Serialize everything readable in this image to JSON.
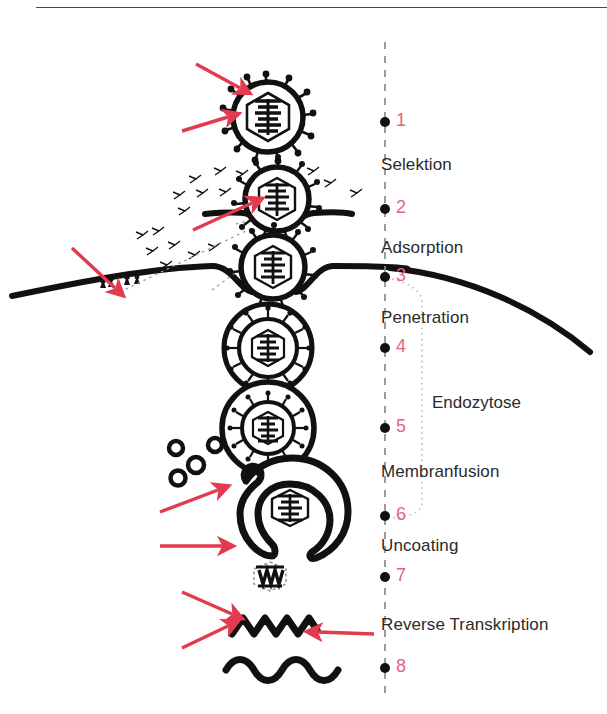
{
  "figure": {
    "colors": {
      "arrow_red": "#e23a4e",
      "number_red": "#e8647a",
      "ink_black": "#111111",
      "text_gray": "#2b2b2b",
      "rule_gray": "#4a4a4a",
      "background": "#ffffff"
    }
  },
  "timeline": {
    "axis_name": "infection-stage-axis",
    "points": [
      {
        "num": "1",
        "x": 385,
        "y": 122,
        "label": "",
        "label_x": 0,
        "label_y": 0
      },
      {
        "num": "2",
        "x": 385,
        "y": 209,
        "label": "Selektion",
        "label_x": 381,
        "label_y": 155
      },
      {
        "num": "3",
        "x": 385,
        "y": 277,
        "label": "Adsorption",
        "label_x": 381,
        "label_y": 238
      },
      {
        "num": "4",
        "x": 385,
        "y": 348,
        "label": "Penetration",
        "label_x": 381,
        "label_y": 308
      },
      {
        "num": "5",
        "x": 385,
        "y": 428,
        "label": "",
        "label_x": 0,
        "label_y": 0
      },
      {
        "num": "6",
        "x": 385,
        "y": 516,
        "label": "Membranfusion",
        "label_x": 381,
        "label_y": 462
      },
      {
        "num": "7",
        "x": 385,
        "y": 577,
        "label": "Uncoating",
        "label_x": 381,
        "label_y": 536
      },
      {
        "num": "8",
        "x": 385,
        "y": 668,
        "label": "Reverse Transkription",
        "label_x": 381,
        "label_y": 615
      }
    ]
  },
  "bracket": {
    "label": "Endozytose",
    "label_x": 432,
    "label_y": 393
  },
  "stages": [
    {
      "name": "free-virion",
      "num": "1"
    },
    {
      "name": "virion-at-membrane-selektion",
      "num": "2"
    },
    {
      "name": "virion-adsorbed-invagination",
      "num": "3"
    },
    {
      "name": "virion-in-endosome-penetration",
      "num": "4"
    },
    {
      "name": "virion-in-endosome-vesicle",
      "num": "5"
    },
    {
      "name": "membrane-fusion-open-vesicle",
      "num": "6"
    },
    {
      "name": "bare-capsid-uncoating",
      "num": "7"
    },
    {
      "name": "rna-and-dna-strands",
      "num": "8"
    }
  ]
}
